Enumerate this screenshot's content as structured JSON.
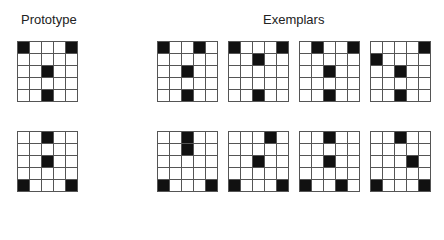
{
  "labels": {
    "prototype": "Prototype",
    "exemplars": "Exemplars"
  },
  "colors": {
    "filled": "#111111",
    "empty": "#ffffff",
    "gridline": "#555555"
  },
  "rows": [
    {
      "prototype": [
        [
          0,
          0
        ],
        [
          0,
          4
        ],
        [
          2,
          2
        ],
        [
          4,
          2
        ]
      ],
      "exemplars": [
        [
          [
            0,
            0
          ],
          [
            0,
            3
          ],
          [
            2,
            2
          ],
          [
            4,
            2
          ]
        ],
        [
          [
            0,
            0
          ],
          [
            0,
            4
          ],
          [
            1,
            2
          ],
          [
            4,
            2
          ]
        ],
        [
          [
            0,
            1
          ],
          [
            0,
            4
          ],
          [
            2,
            2
          ],
          [
            4,
            2
          ]
        ],
        [
          [
            0,
            4
          ],
          [
            1,
            0
          ],
          [
            2,
            2
          ],
          [
            4,
            2
          ]
        ]
      ]
    },
    {
      "prototype": [
        [
          0,
          2
        ],
        [
          2,
          2
        ],
        [
          4,
          0
        ],
        [
          4,
          4
        ]
      ],
      "exemplars": [
        [
          [
            0,
            2
          ],
          [
            1,
            2
          ],
          [
            4,
            0
          ],
          [
            4,
            4
          ]
        ],
        [
          [
            0,
            3
          ],
          [
            2,
            2
          ],
          [
            4,
            0
          ],
          [
            4,
            4
          ]
        ],
        [
          [
            0,
            2
          ],
          [
            2,
            2
          ],
          [
            4,
            0
          ],
          [
            4,
            3
          ]
        ],
        [
          [
            0,
            2
          ],
          [
            2,
            3
          ],
          [
            4,
            0
          ],
          [
            4,
            4
          ]
        ]
      ]
    }
  ]
}
